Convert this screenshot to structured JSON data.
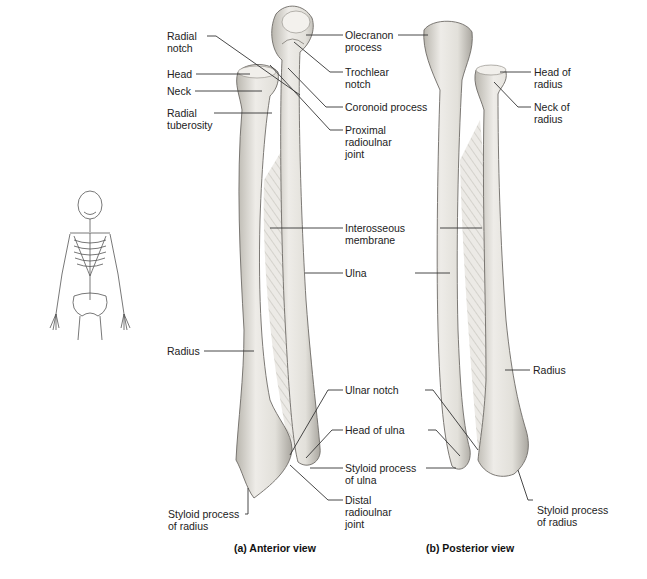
{
  "figure": {
    "views": [
      {
        "id": "anterior",
        "caption": "(a) Anterior view"
      },
      {
        "id": "posterior",
        "caption": "(b) Posterior view"
      }
    ],
    "locator_icon": "skeleton-icon",
    "colors": {
      "background": "#ffffff",
      "bone_fill": "#e6e4df",
      "bone_shade": "#b9b6ae",
      "bone_outline": "#6e6b66",
      "membrane": "#d9d7d2",
      "leader_line": "#333333",
      "text": "#222222"
    }
  },
  "labels": {
    "anterior": {
      "radial_notch": [
        "Radial",
        "notch"
      ],
      "head": "Head",
      "neck": "Neck",
      "radial_tuberosity": [
        "Radial",
        "tuberosity"
      ],
      "radius": "Radius",
      "styloid_process_radius": [
        "Styloid process",
        "of radius"
      ],
      "olecranon_process": [
        "Olecranon",
        "process"
      ],
      "trochlear_notch": [
        "Trochlear",
        "notch"
      ],
      "coronoid_process": "Coronoid process",
      "proximal_radioulnar_joint": [
        "Proximal",
        "radioulnar",
        "joint"
      ],
      "interosseous_membrane": [
        "Interosseous",
        "membrane"
      ],
      "ulna": "Ulna",
      "ulnar_notch": "Ulnar notch",
      "head_of_ulna": "Head of ulna",
      "styloid_process_ulna": [
        "Styloid process",
        "of ulna"
      ],
      "distal_radioulnar_joint": [
        "Distal",
        "radioulnar",
        "joint"
      ]
    },
    "posterior": {
      "head_of_radius": [
        "Head of",
        "radius"
      ],
      "neck_of_radius": [
        "Neck of",
        "radius"
      ],
      "radius": "Radius",
      "styloid_process_radius": [
        "Styloid process",
        "of radius"
      ]
    }
  }
}
